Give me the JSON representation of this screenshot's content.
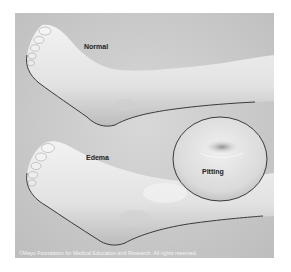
{
  "illustration": {
    "subject": "Foot and ankle edema comparison",
    "labels": {
      "normal": "Normal",
      "edema": "Edema",
      "pitting": "Pitting"
    },
    "credit": "©Mayo Foundation for Medical Education and Research. All rights reserved."
  },
  "colors": {
    "background": "#ffffff",
    "panel": "#c9c9c9",
    "skin_light": "#eeeeee",
    "skin_shadow": "#b8b8b8",
    "outline": "#3a3a3a"
  }
}
